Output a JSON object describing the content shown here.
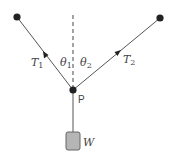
{
  "diagram": {
    "title": "",
    "colors": {
      "line": "#555555",
      "dot": "#222222",
      "weight_fill": "#b5b5b5",
      "weight_stroke": "#666666",
      "text": "#444444"
    },
    "labels": {
      "tension_left": "T",
      "tension_left_sub": "1",
      "tension_right": "T",
      "tension_right_sub": "2",
      "angle_left": "θ",
      "angle_left_sub": "1",
      "angle_right": "θ",
      "angle_right_sub": "2",
      "point": "P",
      "weight": "W"
    },
    "nodes": {
      "anchor_left": {
        "x": 17,
        "y": 17
      },
      "anchor_right": {
        "x": 160,
        "y": 18
      },
      "junction_p": {
        "x": 73,
        "y": 90
      },
      "weight_box": {
        "x": 66,
        "y": 132,
        "w": 14,
        "h": 18
      }
    }
  }
}
